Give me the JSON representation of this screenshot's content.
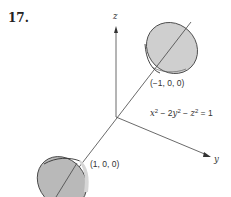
{
  "problem": {
    "number": "17.",
    "equation": {
      "parts": [
        "x",
        "2",
        " − 2",
        "y",
        "2",
        " − ",
        "z",
        "2",
        " = 1"
      ],
      "text": "x² − 2y² − z² = 1"
    }
  },
  "axes": {
    "z_label": "z",
    "y_label": "y"
  },
  "points": {
    "upper": "(−1, 0, 0)",
    "lower": "(1, 0, 0)"
  },
  "colors": {
    "surface_fill": "#c8c8c8",
    "surface_fill_dark": "#b0b0b0",
    "line": "#444444",
    "background": "#ffffff"
  }
}
